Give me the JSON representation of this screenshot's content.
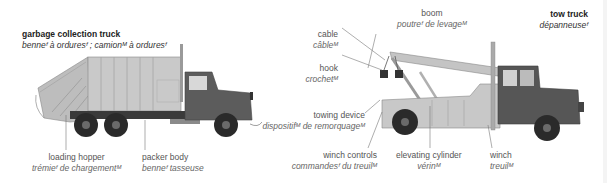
{
  "garbage_truck": {
    "title": {
      "en": "garbage collection truck",
      "fr": "benneᶠ à orduresᶠ ; camionᴹ à orduresᶠ"
    },
    "labels": [
      {
        "id": "loading-hopper",
        "en": "loading hopper",
        "fr": "trémieᶠ de chargementᴹ"
      },
      {
        "id": "packer-body",
        "en": "packer body",
        "fr": "benneᶠ tasseuse"
      }
    ]
  },
  "tow_truck": {
    "title": {
      "en": "tow truck",
      "fr": "dépanneuseᶠ"
    },
    "labels": [
      {
        "id": "boom",
        "en": "boom",
        "fr": "poutreᶠ de levageᴹ"
      },
      {
        "id": "cable",
        "en": "cable",
        "fr": "câbleᴹ"
      },
      {
        "id": "hook",
        "en": "hook",
        "fr": "crochetᴹ"
      },
      {
        "id": "towing-device",
        "en": "towing device",
        "fr": "dispositifᴹ de remorquageᴹ"
      },
      {
        "id": "winch-controls",
        "en": "winch controls",
        "fr": "commandesᶠ du treuilᴹ"
      },
      {
        "id": "elevating-cylinder",
        "en": "elevating cylinder",
        "fr": "vérinᴹ"
      },
      {
        "id": "winch",
        "en": "winch",
        "fr": "treuilᴹ"
      }
    ]
  },
  "colors": {
    "body_light": "#c8c8c8",
    "body_mid": "#a9a9a9",
    "cab_dark": "#555555",
    "tire": "#2a2a2a",
    "leader_line": "#777777"
  }
}
